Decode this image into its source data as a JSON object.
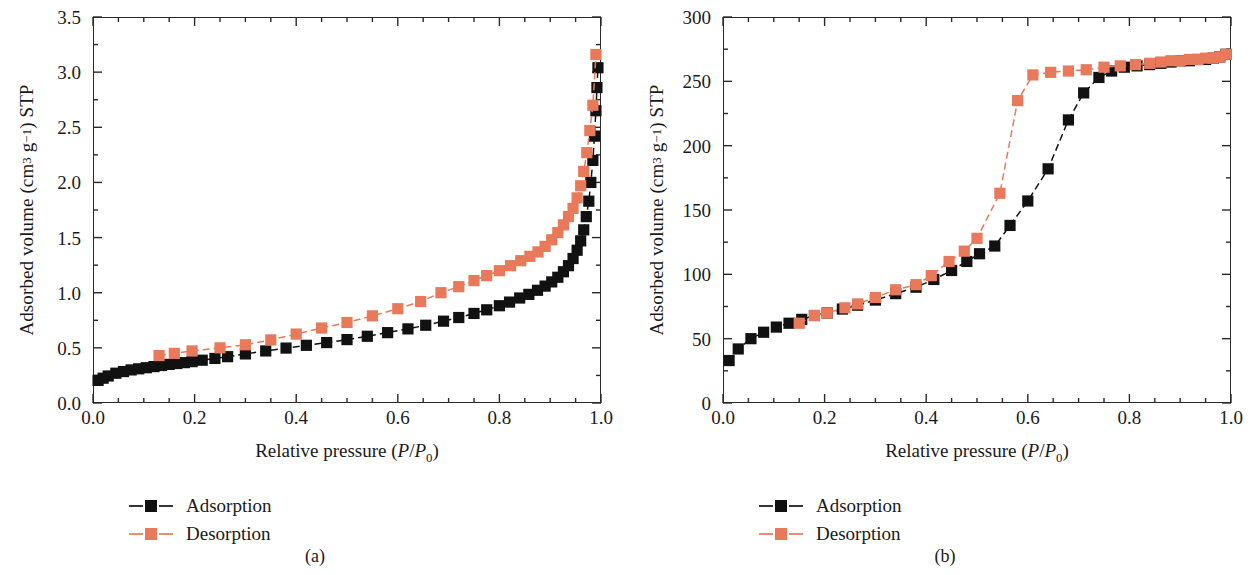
{
  "figure": {
    "background": "#ffffff",
    "series_colors": {
      "adsorption": "#111111",
      "desorption": "#E8795A"
    }
  },
  "panels": [
    {
      "caption": "(a)",
      "legend": [
        {
          "label": "Adsorption",
          "color": "#111111",
          "key": "square-marker-dashed-line"
        },
        {
          "label": "Desorption",
          "color": "#E8795A",
          "key": "square-marker-dashed-line"
        }
      ],
      "chart_data": {
        "type": "scatter",
        "title": "",
        "xlabel": "Relative pressure (P/P0)",
        "ylabel": "Adsorbed volume (cm3 g-1) STP",
        "xlim": [
          0.0,
          1.0
        ],
        "ylim": [
          0.0,
          3.5
        ],
        "xticks": [
          "0.0",
          "0.2",
          "0.4",
          "0.6",
          "0.8",
          "1.0"
        ],
        "xtick_values": [
          0.0,
          0.2,
          0.4,
          0.6,
          0.8,
          1.0
        ],
        "yticks": [
          "0.0",
          "0.5",
          "1.0",
          "1.5",
          "2.0",
          "2.5",
          "3.0",
          "3.5"
        ],
        "ytick_values": [
          0.0,
          0.5,
          1.0,
          1.5,
          2.0,
          2.5,
          3.0,
          3.5
        ],
        "x_minor_step": 0.05,
        "y_minor_step": 0.25,
        "grid": false,
        "legend_position": "below-axes-left",
        "series": [
          {
            "name": "Adsorption",
            "color": "#111111",
            "x": [
              0.01,
              0.02,
              0.03,
              0.045,
              0.06,
              0.075,
              0.09,
              0.105,
              0.12,
              0.135,
              0.15,
              0.165,
              0.18,
              0.195,
              0.215,
              0.24,
              0.265,
              0.3,
              0.34,
              0.38,
              0.42,
              0.46,
              0.5,
              0.54,
              0.58,
              0.62,
              0.655,
              0.69,
              0.72,
              0.75,
              0.775,
              0.8,
              0.82,
              0.84,
              0.858,
              0.875,
              0.89,
              0.903,
              0.915,
              0.926,
              0.936,
              0.945,
              0.953,
              0.96,
              0.966,
              0.971,
              0.976,
              0.98,
              0.984,
              0.987,
              0.99,
              0.992,
              0.994
            ],
            "y": [
              0.205,
              0.225,
              0.245,
              0.27,
              0.285,
              0.3,
              0.31,
              0.32,
              0.33,
              0.34,
              0.35,
              0.358,
              0.366,
              0.375,
              0.388,
              0.404,
              0.42,
              0.445,
              0.472,
              0.498,
              0.523,
              0.548,
              0.575,
              0.605,
              0.638,
              0.672,
              0.705,
              0.742,
              0.775,
              0.812,
              0.845,
              0.882,
              0.915,
              0.952,
              0.985,
              1.022,
              1.06,
              1.098,
              1.14,
              1.19,
              1.245,
              1.31,
              1.385,
              1.47,
              1.57,
              1.69,
              1.83,
              2.0,
              2.2,
              2.42,
              2.65,
              2.86,
              3.04
            ]
          },
          {
            "name": "Desorption",
            "color": "#E8795A",
            "x": [
              0.13,
              0.16,
              0.195,
              0.25,
              0.3,
              0.35,
              0.4,
              0.45,
              0.5,
              0.55,
              0.6,
              0.645,
              0.685,
              0.72,
              0.75,
              0.775,
              0.8,
              0.822,
              0.842,
              0.86,
              0.876,
              0.89,
              0.903,
              0.915,
              0.926,
              0.936,
              0.945,
              0.953,
              0.96,
              0.966,
              0.972,
              0.978,
              0.984,
              0.99
            ],
            "y": [
              0.43,
              0.45,
              0.472,
              0.5,
              0.528,
              0.572,
              0.625,
              0.68,
              0.73,
              0.79,
              0.855,
              0.92,
              1.0,
              1.055,
              1.11,
              1.155,
              1.2,
              1.245,
              1.29,
              1.33,
              1.37,
              1.42,
              1.48,
              1.545,
              1.615,
              1.69,
              1.765,
              1.86,
              1.97,
              2.1,
              2.27,
              2.47,
              2.7,
              3.16
            ]
          }
        ]
      }
    },
    {
      "caption": "(b)",
      "legend": [
        {
          "label": "Adsorption",
          "color": "#111111",
          "key": "square-marker-dashed-line"
        },
        {
          "label": "Desorption",
          "color": "#E8795A",
          "key": "square-marker-dashed-line"
        }
      ],
      "chart_data": {
        "type": "scatter",
        "title": "",
        "xlabel": "Relative pressure (P/P0)",
        "ylabel": "Adsorbed volume (cm3 g-1) STP",
        "xlim": [
          0.0,
          1.0
        ],
        "ylim": [
          0,
          300
        ],
        "xticks": [
          "0.0",
          "0.2",
          "0.4",
          "0.6",
          "0.8",
          "1.0"
        ],
        "xtick_values": [
          0.0,
          0.2,
          0.4,
          0.6,
          0.8,
          1.0
        ],
        "yticks": [
          "0",
          "50",
          "100",
          "150",
          "200",
          "250",
          "300"
        ],
        "ytick_values": [
          0,
          50,
          100,
          150,
          200,
          250,
          300
        ],
        "x_minor_step": 0.05,
        "y_minor_step": 25,
        "grid": false,
        "legend_position": "below-axes-left",
        "series": [
          {
            "name": "Adsorption",
            "color": "#111111",
            "x": [
              0.012,
              0.03,
              0.055,
              0.08,
              0.105,
              0.13,
              0.155,
              0.18,
              0.205,
              0.235,
              0.265,
              0.3,
              0.34,
              0.38,
              0.415,
              0.45,
              0.48,
              0.505,
              0.535,
              0.565,
              0.6,
              0.64,
              0.68,
              0.71,
              0.74,
              0.765,
              0.79,
              0.815,
              0.84,
              0.862,
              0.882,
              0.9,
              0.918,
              0.935,
              0.95,
              0.965,
              0.978,
              0.99
            ],
            "y": [
              33,
              42,
              50,
              55,
              59,
              62,
              65,
              68,
              70,
              73,
              76,
              80,
              85,
              90,
              96,
              103,
              110,
              116,
              122,
              138,
              157,
              182,
              220,
              241,
              253,
              258,
              261,
              262,
              263,
              264,
              265,
              266,
              266,
              267,
              267,
              268,
              269,
              271
            ]
          },
          {
            "name": "Desorption",
            "color": "#E8795A",
            "x": [
              0.15,
              0.18,
              0.205,
              0.24,
              0.265,
              0.3,
              0.34,
              0.38,
              0.41,
              0.445,
              0.475,
              0.5,
              0.545,
              0.58,
              0.61,
              0.645,
              0.68,
              0.715,
              0.75,
              0.782,
              0.812,
              0.84,
              0.862,
              0.882,
              0.9,
              0.918,
              0.935,
              0.95,
              0.965,
              0.978,
              0.99
            ],
            "y": [
              62,
              68,
              70,
              74,
              77,
              82,
              88,
              92,
              99,
              110,
              118,
              128,
              163,
              235,
              255,
              257,
              258,
              259,
              261,
              262,
              263,
              264,
              265,
              266,
              266,
              267,
              267,
              268,
              268,
              269,
              271
            ]
          }
        ]
      }
    }
  ]
}
